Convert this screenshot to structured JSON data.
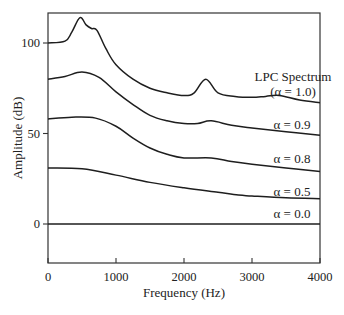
{
  "chart_data": {
    "type": "line",
    "title": "",
    "xlabel": "Frequency (Hz)",
    "ylabel": "Amplitude (dB)",
    "xlim": [
      0,
      4000
    ],
    "ylim": [
      -20,
      117
    ],
    "xticks": [
      0,
      1000,
      2000,
      3000,
      4000
    ],
    "xtick_labels": [
      "0",
      "1000",
      "2000",
      "3000",
      "4000"
    ],
    "yticks": [
      0,
      50,
      100
    ],
    "ytick_labels": [
      "0",
      "50",
      "100"
    ],
    "grid": false,
    "legend": "none",
    "series": [
      {
        "name": "LPC Spectrum (α = 1.0)",
        "label_lines": [
          "LPC Spectrum",
          "(α = 1.0)"
        ],
        "x": [
          0,
          250,
          350,
          470,
          560,
          640,
          720,
          850,
          1000,
          1250,
          1500,
          1750,
          2000,
          2150,
          2320,
          2500,
          2750,
          3000,
          3200,
          3400,
          3700,
          4000
        ],
        "y": [
          100,
          101,
          106,
          114,
          110,
          108,
          107,
          97,
          88,
          80,
          75,
          72.5,
          71,
          72.5,
          80,
          72.5,
          70.5,
          70,
          70.5,
          71,
          68.5,
          67
        ]
      },
      {
        "name": "α = 0.9",
        "label_lines": [
          "α = 0.9"
        ],
        "x": [
          0,
          250,
          500,
          750,
          1000,
          1250,
          1500,
          1750,
          2000,
          2200,
          2400,
          2700,
          3000,
          3500,
          4000
        ],
        "y": [
          80,
          81.5,
          84,
          81,
          73,
          66,
          60,
          57,
          55.5,
          55.5,
          57,
          54.5,
          53,
          51,
          49
        ]
      },
      {
        "name": "α = 0.8",
        "label_lines": [
          "α = 0.8"
        ],
        "x": [
          0,
          350,
          700,
          1000,
          1250,
          1500,
          1750,
          2000,
          2400,
          2700,
          3000,
          3500,
          4000
        ],
        "y": [
          58,
          59,
          58.5,
          54,
          47.5,
          42,
          38.5,
          36.5,
          36.5,
          34.5,
          33,
          31,
          29
        ]
      },
      {
        "name": "α = 0.5",
        "label_lines": [
          "α = 0.5"
        ],
        "x": [
          0,
          500,
          1000,
          1500,
          2000,
          2500,
          2800,
          3000,
          3500,
          4000
        ],
        "y": [
          31,
          30.5,
          27,
          23,
          20,
          17.5,
          16,
          15.5,
          14.5,
          14
        ]
      },
      {
        "name": "α = 0.0",
        "label_lines": [
          "α = 0.0"
        ],
        "x": [
          0,
          4000
        ],
        "y": [
          0,
          0
        ]
      }
    ]
  }
}
